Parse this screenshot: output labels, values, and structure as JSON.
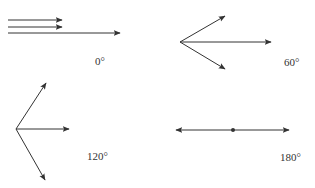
{
  "panels": [
    {
      "label": "0°",
      "description": "three parallel vectors pointing right"
    },
    {
      "label": "60°",
      "description": "three vectors from a common origin spread at 60 degrees"
    },
    {
      "label": "120°",
      "description": "three vectors from a common origin spread at 120 degrees"
    },
    {
      "label": "180°",
      "description": "two opposite vectors from a central point"
    }
  ],
  "colors": {
    "stroke": "#333333",
    "background": "#ffffff"
  }
}
